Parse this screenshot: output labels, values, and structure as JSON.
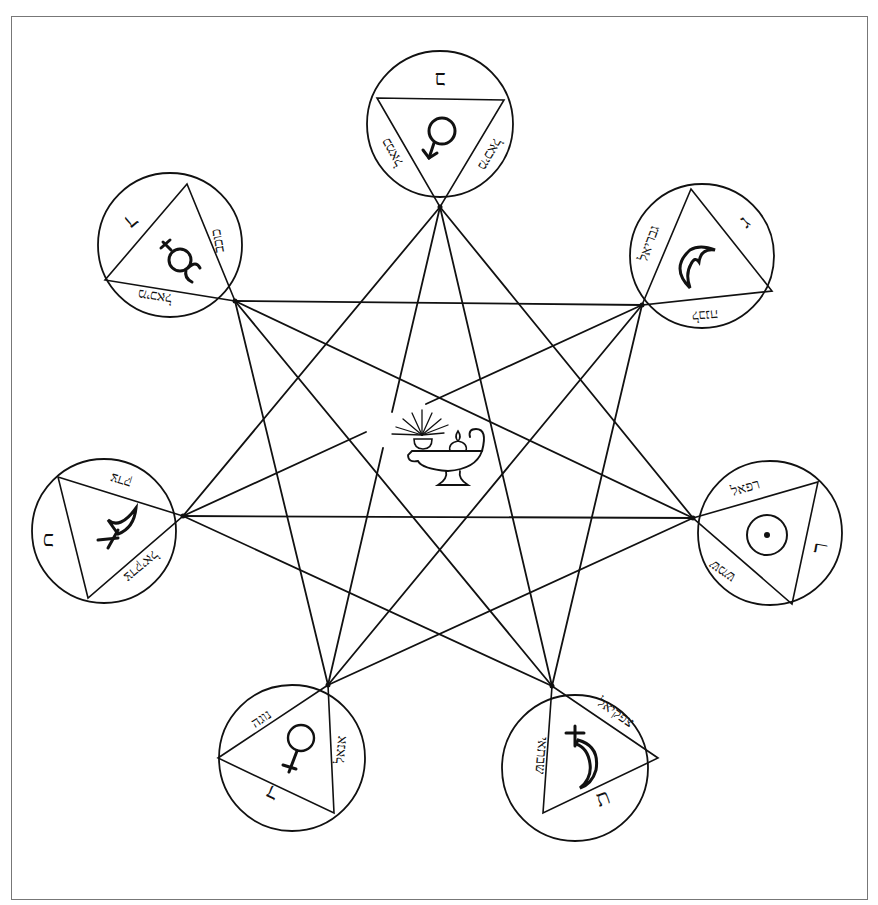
{
  "diagram": {
    "type": "heptagram with seven planetary seals",
    "center": {
      "label": "oil-lamp",
      "icon": "oil-lamp-icon"
    },
    "seals": [
      {
        "position": "top",
        "planet": "Mercury",
        "symbol": "☿",
        "corner_letter": "ב",
        "side_left": "כמאל",
        "side_right": "מיכאל"
      },
      {
        "position": "upper-left",
        "planet": "Mercury (variant)",
        "symbol": "☿",
        "corner_letter": "ד",
        "side_top": "כוכב",
        "side_bottom": "מיכאל"
      },
      {
        "position": "upper-right",
        "planet": "Moon",
        "symbol": "☽",
        "corner_letter": "ג",
        "side_left": "גבריאל",
        "side_bottom": "לבנה"
      },
      {
        "position": "left",
        "planet": "Jupiter",
        "symbol": "♃",
        "corner_letter": "כ",
        "side_top": "צדק",
        "side_bottom": "צדקיאל"
      },
      {
        "position": "right",
        "planet": "Sun",
        "symbol": "☉",
        "corner_letter": "ר",
        "side_top": "רפאל",
        "side_bottom": "שמש"
      },
      {
        "position": "lower-left",
        "planet": "Venus",
        "symbol": "♀",
        "corner_letter": "ד",
        "side_top": "נוגה",
        "side_right": "אנאל"
      },
      {
        "position": "lower-right",
        "planet": "Saturn",
        "symbol": "♄",
        "corner_letter": "ת",
        "side_left": "שבתאי",
        "side_right": "צפקיאל"
      }
    ]
  }
}
